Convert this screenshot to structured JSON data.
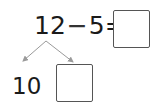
{
  "equation": {
    "minuend": "12",
    "operator": "−",
    "subtrahend": "5",
    "equals": "=",
    "answer": ""
  },
  "decomposition": {
    "known_part": "10",
    "unknown_part": ""
  },
  "colors": {
    "text": "#1a1a1a",
    "arrow": "#9a9a9a",
    "box_border": "#555555"
  }
}
